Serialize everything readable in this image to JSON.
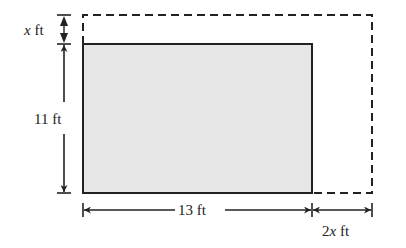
{
  "figure": {
    "type": "dimension-diagram"
  },
  "inner_rectangle": {
    "width_label": "13 ft",
    "height_label": "11 ft",
    "fill": "#e6e6e6",
    "stroke": "#222222"
  },
  "outer_rectangle": {
    "style": "dashed",
    "stroke": "#222222"
  },
  "dimensions": {
    "top_extension": {
      "var": "x",
      "unit": "ft"
    },
    "right_extension": {
      "coef": "2",
      "var": "x",
      "unit": "ft"
    },
    "height": {
      "text": "11 ft"
    },
    "width": {
      "text": "13 ft"
    }
  }
}
